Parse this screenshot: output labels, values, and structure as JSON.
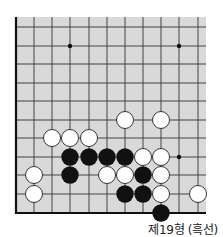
{
  "diagram": {
    "caption": "제19형 (흑선)",
    "board": {
      "background": "#d9d9d9",
      "line_color": "#333333",
      "columns_x": [
        16,
        34,
        52,
        70,
        89,
        107,
        125,
        143,
        161,
        179,
        198
      ],
      "rows_y": [
        27,
        46,
        64,
        83,
        101,
        120,
        138,
        157,
        175,
        194,
        213
      ],
      "board_left": 16,
      "board_top": 17,
      "board_right": 206,
      "board_bottom": 213,
      "left_edge": true,
      "bottom_edge": true,
      "star_points": [
        [
          3,
          1
        ],
        [
          9,
          1
        ],
        [
          9,
          7
        ]
      ],
      "stones": [
        {
          "color": "white",
          "col": 6,
          "row": 5
        },
        {
          "color": "white",
          "col": 8,
          "row": 5
        },
        {
          "color": "white",
          "col": 2,
          "row": 6
        },
        {
          "color": "white",
          "col": 3,
          "row": 6
        },
        {
          "color": "white",
          "col": 4,
          "row": 6
        },
        {
          "color": "black",
          "col": 3,
          "row": 7
        },
        {
          "color": "black",
          "col": 4,
          "row": 7
        },
        {
          "color": "black",
          "col": 5,
          "row": 7
        },
        {
          "color": "black",
          "col": 6,
          "row": 7
        },
        {
          "color": "white",
          "col": 7,
          "row": 7
        },
        {
          "color": "white",
          "col": 8,
          "row": 7
        },
        {
          "color": "white",
          "col": 1,
          "row": 8
        },
        {
          "color": "black",
          "col": 3,
          "row": 8
        },
        {
          "color": "white",
          "col": 5,
          "row": 8
        },
        {
          "color": "white",
          "col": 6,
          "row": 8
        },
        {
          "color": "black",
          "col": 7,
          "row": 8
        },
        {
          "color": "white",
          "col": 8,
          "row": 8
        },
        {
          "color": "white",
          "col": 1,
          "row": 9
        },
        {
          "color": "black",
          "col": 6,
          "row": 9
        },
        {
          "color": "black",
          "col": 7,
          "row": 9
        },
        {
          "color": "white",
          "col": 8,
          "row": 9
        },
        {
          "color": "white",
          "col": 10,
          "row": 9
        },
        {
          "color": "black",
          "col": 8,
          "row": 10
        }
      ]
    }
  }
}
